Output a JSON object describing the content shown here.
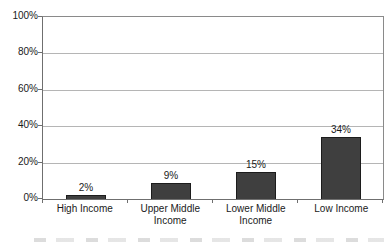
{
  "chart_data": {
    "type": "bar",
    "categories": [
      "High Income",
      "Upper Middle Income",
      "Lower Middle Income",
      "Low Income"
    ],
    "values": [
      2,
      9,
      15,
      34
    ],
    "value_labels": [
      "2%",
      "9%",
      "15%",
      "34%"
    ],
    "title": "",
    "xlabel": "",
    "ylabel": "",
    "ylim": [
      0,
      100
    ],
    "ytick_step": 20,
    "ytick_labels": [
      "0%",
      "20%",
      "40%",
      "60%",
      "80%",
      "100%"
    ],
    "grid": true,
    "legend": "none",
    "colors": {
      "bar_fill": "#3f3f3f",
      "bar_border": "#1c1c1c",
      "gridline": "#b5b5b5",
      "axis": "#6f6f6f",
      "plot_border": "#8a8a8a",
      "text": "#1a1a1a",
      "background": "#ffffff"
    }
  }
}
